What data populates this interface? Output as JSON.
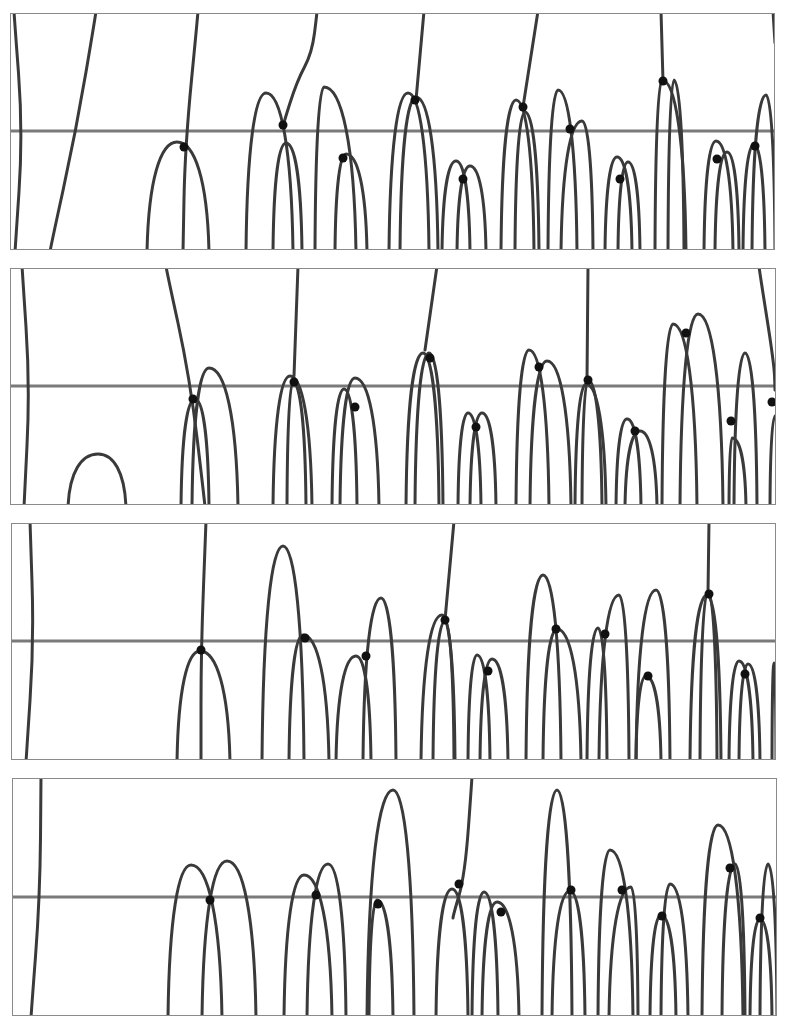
{
  "figure": {
    "width": 799,
    "height": 1023,
    "colors": {
      "frame": "#8a8a8a",
      "axis_line": "#7a7a7a",
      "curve": "#3a3a3a",
      "dot": "#111111",
      "background": "#ffffff"
    }
  },
  "panels": [
    {
      "id": 1,
      "box": [
        10,
        13,
        765,
        237
      ],
      "axis_y": 118,
      "arches": [
        [
          137,
          237,
          167,
          129,
          199,
          237
        ],
        [
          236,
          237,
          256,
          80,
          283,
          237
        ],
        [
          263,
          237,
          276,
          130,
          292,
          237
        ],
        [
          305,
          237,
          314,
          74,
          346,
          237
        ],
        [
          325,
          237,
          336,
          141,
          357,
          237
        ],
        [
          379,
          237,
          398,
          80,
          419,
          237
        ],
        [
          390,
          237,
          406,
          84,
          428,
          237
        ],
        [
          432,
          237,
          446,
          148,
          460,
          237
        ],
        [
          447,
          237,
          460,
          153,
          476,
          237
        ],
        [
          491,
          237,
          506,
          87,
          524,
          237
        ],
        [
          505,
          237,
          515,
          99,
          529,
          237
        ],
        [
          538,
          237,
          548,
          77,
          567,
          237
        ],
        [
          551,
          237,
          572,
          108,
          583,
          237
        ],
        [
          595,
          237,
          607,
          144,
          622,
          237
        ],
        [
          608,
          237,
          618,
          149,
          630,
          237
        ],
        [
          645,
          237,
          652,
          67,
          676,
          237
        ],
        [
          658,
          237,
          664,
          67,
          674,
          237
        ],
        [
          694,
          237,
          706,
          128,
          723,
          237
        ],
        [
          705,
          237,
          717,
          139,
          729,
          237
        ],
        [
          733,
          237,
          744,
          131,
          755,
          237
        ],
        [
          742,
          237,
          756,
          82,
          765,
          237
        ]
      ],
      "lines": [
        [
          [
            4,
            0
          ],
          [
            13,
            120
          ],
          [
            5,
            237
          ]
        ],
        [
          [
            86,
            0
          ],
          [
            66,
            118
          ],
          [
            40,
            237
          ]
        ],
        [
          [
            188,
            0
          ],
          [
            175,
            134
          ],
          [
            173,
            237
          ]
        ],
        [
          [
            307,
            0
          ],
          [
            302,
            40
          ],
          [
            287,
            68
          ],
          [
            273,
            112
          ]
        ],
        [
          [
            414,
            0
          ],
          [
            406,
            87
          ]
        ],
        [
          [
            528,
            0
          ],
          [
            513,
            94
          ]
        ],
        [
          [
            651,
            0
          ],
          [
            653,
            68
          ]
        ],
        [
          [
            763,
            0
          ],
          [
            765,
            30
          ]
        ]
      ],
      "dots": [
        [
          174,
          134
        ],
        [
          273,
          112
        ],
        [
          333,
          145
        ],
        [
          405,
          87
        ],
        [
          453,
          166
        ],
        [
          513,
          94
        ],
        [
          560,
          116
        ],
        [
          610,
          166
        ],
        [
          653,
          68
        ],
        [
          707,
          146
        ],
        [
          745,
          133
        ]
      ]
    },
    {
      "id": 2,
      "box": [
        10,
        268,
        766,
        237
      ],
      "axis_y": 118,
      "arches": [
        [
          58,
          237,
          88,
          186,
          116,
          237
        ],
        [
          171,
          237,
          185,
          131,
          199,
          237
        ],
        [
          182,
          237,
          199,
          100,
          228,
          237
        ],
        [
          263,
          237,
          280,
          108,
          302,
          237
        ],
        [
          277,
          237,
          283,
          114,
          296,
          237
        ],
        [
          322,
          237,
          334,
          121,
          347,
          237
        ],
        [
          330,
          237,
          345,
          110,
          369,
          237
        ],
        [
          396,
          237,
          413,
          85,
          429,
          237
        ],
        [
          405,
          237,
          419,
          85,
          433,
          237
        ],
        [
          448,
          237,
          458,
          145,
          471,
          237
        ],
        [
          460,
          237,
          472,
          145,
          486,
          237
        ],
        [
          506,
          237,
          519,
          82,
          539,
          237
        ],
        [
          520,
          237,
          537,
          93,
          561,
          237
        ],
        [
          565,
          237,
          576,
          116,
          596,
          237
        ],
        [
          572,
          237,
          578,
          112,
          592,
          237
        ],
        [
          606,
          237,
          617,
          151,
          631,
          237
        ],
        [
          615,
          237,
          630,
          163,
          647,
          237
        ],
        [
          652,
          237,
          663,
          56,
          687,
          237
        ],
        [
          670,
          237,
          688,
          46,
          713,
          237
        ],
        [
          719,
          237,
          722,
          170,
          736,
          237
        ],
        [
          724,
          237,
          735,
          85,
          747,
          237
        ],
        [
          760,
          237,
          765,
          148,
          770,
          237
        ]
      ],
      "lines": [
        [
          [
            12,
            0
          ],
          [
            20,
            118
          ],
          [
            14,
            237
          ]
        ],
        [
          [
            156,
            0
          ],
          [
            180,
            110
          ],
          [
            195,
            237
          ]
        ],
        [
          [
            288,
            0
          ],
          [
            284,
            108
          ]
        ],
        [
          [
            427,
            0
          ],
          [
            415,
            82
          ]
        ],
        [
          [
            578,
            0
          ],
          [
            577,
            112
          ]
        ],
        [
          [
            749,
            0
          ],
          [
            764,
            95
          ],
          [
            765,
            120
          ]
        ]
      ],
      "dots": [
        [
          183,
          131
        ],
        [
          284,
          114
        ],
        [
          345,
          139
        ],
        [
          420,
          90
        ],
        [
          466,
          159
        ],
        [
          529,
          99
        ],
        [
          578,
          112
        ],
        [
          625,
          163
        ],
        [
          676,
          65
        ],
        [
          721,
          153
        ],
        [
          762,
          134
        ]
      ]
    },
    {
      "id": 3,
      "box": [
        11,
        523,
        765,
        237
      ],
      "axis_y": 118,
      "arches": [
        [
          166,
          237,
          189,
          128,
          219,
          237
        ],
        [
          251,
          237,
          272,
          23,
          293,
          237
        ],
        [
          278,
          237,
          292,
          112,
          318,
          237
        ],
        [
          325,
          237,
          345,
          133,
          360,
          237
        ],
        [
          352,
          237,
          370,
          75,
          385,
          237
        ],
        [
          410,
          237,
          431,
          92,
          444,
          237
        ],
        [
          422,
          237,
          434,
          98,
          443,
          237
        ],
        [
          457,
          237,
          466,
          132,
          479,
          237
        ],
        [
          469,
          237,
          481,
          136,
          497,
          237
        ],
        [
          515,
          237,
          532,
          52,
          550,
          237
        ],
        [
          532,
          237,
          546,
          106,
          570,
          237
        ],
        [
          576,
          237,
          587,
          105,
          596,
          237
        ],
        [
          588,
          237,
          608,
          72,
          618,
          237
        ],
        [
          625,
          237,
          635,
          153,
          650,
          237
        ],
        [
          625,
          237,
          645,
          67,
          659,
          237
        ],
        [
          679,
          237,
          696,
          72,
          710,
          237
        ],
        [
          689,
          237,
          697,
          68,
          706,
          237
        ],
        [
          718,
          237,
          728,
          138,
          742,
          237
        ],
        [
          728,
          237,
          737,
          141,
          749,
          237
        ],
        [
          761,
          237,
          763,
          140,
          765,
          237
        ]
      ],
      "lines": [
        [
          [
            19,
            0
          ],
          [
            23,
            118
          ],
          [
            15,
            237
          ]
        ],
        [
          [
            195,
            0
          ],
          [
            190,
            127
          ],
          [
            190,
            237
          ]
        ],
        [
          [
            443,
            0
          ],
          [
            434,
            97
          ]
        ],
        [
          [
            698,
            0
          ],
          [
            697,
            70
          ]
        ]
      ],
      "dots": [
        [
          190,
          127
        ],
        [
          294,
          115
        ],
        [
          355,
          133
        ],
        [
          434,
          97
        ],
        [
          477,
          148
        ],
        [
          545,
          106
        ],
        [
          594,
          111
        ],
        [
          637,
          153
        ],
        [
          698,
          71
        ],
        [
          734,
          151
        ]
      ]
    },
    {
      "id": 4,
      "box": [
        12,
        778,
        765,
        238
      ],
      "axis_y": 119,
      "arches": [
        [
          156,
          238,
          179,
          87,
          210,
          238
        ],
        [
          190,
          238,
          215,
          83,
          244,
          238
        ],
        [
          272,
          238,
          292,
          97,
          320,
          238
        ],
        [
          295,
          238,
          316,
          86,
          334,
          238
        ],
        [
          355,
          238,
          381,
          12,
          402,
          238
        ],
        [
          357,
          238,
          365,
          122,
          381,
          238
        ],
        [
          424,
          238,
          440,
          111,
          456,
          238
        ],
        [
          460,
          238,
          472,
          114,
          486,
          238
        ],
        [
          470,
          238,
          485,
          124,
          507,
          238
        ],
        [
          530,
          238,
          545,
          12,
          560,
          238
        ],
        [
          540,
          238,
          558,
          113,
          573,
          238
        ],
        [
          586,
          238,
          598,
          72,
          621,
          238
        ],
        [
          597,
          238,
          619,
          109,
          626,
          238
        ],
        [
          638,
          238,
          649,
          137,
          664,
          238
        ],
        [
          649,
          238,
          658,
          106,
          676,
          238
        ],
        [
          690,
          238,
          706,
          47,
          731,
          238
        ],
        [
          710,
          238,
          723,
          86,
          733,
          238
        ],
        [
          738,
          238,
          748,
          141,
          760,
          238
        ],
        [
          748,
          238,
          756,
          86,
          765,
          238
        ]
      ],
      "lines": [
        [
          [
            29,
            0
          ],
          [
            28,
            119
          ],
          [
            19,
            238
          ]
        ],
        [
          [
            460,
            0
          ],
          [
            453,
            97
          ],
          [
            441,
            138
          ]
        ]
      ],
      "dots": [
        [
          198,
          122
        ],
        [
          304,
          117
        ],
        [
          366,
          126
        ],
        [
          447,
          106
        ],
        [
          489,
          134
        ],
        [
          559,
          112
        ],
        [
          610,
          112
        ],
        [
          650,
          138
        ],
        [
          718,
          90
        ],
        [
          748,
          140
        ]
      ]
    }
  ]
}
